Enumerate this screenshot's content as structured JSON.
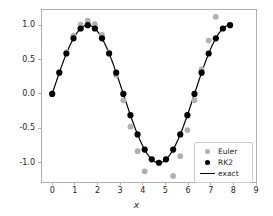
{
  "chart_data": {
    "type": "scatter",
    "title": "",
    "xlabel": "x",
    "ylabel": "",
    "xlim": [
      -0.45,
      9.0
    ],
    "ylim": [
      -1.28,
      1.22
    ],
    "xticks": [
      0,
      1,
      2,
      3,
      4,
      5,
      6,
      7,
      8,
      9
    ],
    "yticks": [
      1.0,
      0.5,
      0.0,
      -0.5,
      -1.0
    ],
    "xticklabels": [
      "0",
      "1",
      "2",
      "3",
      "4",
      "5",
      "6",
      "7",
      "8",
      "9"
    ],
    "yticklabels": [
      "1.0",
      "0.5",
      "0.0",
      "-0.5",
      "-1.0"
    ],
    "grid": false,
    "legend_position": "lower right",
    "step_h": 0.31416,
    "colors": {
      "euler": "#b0b0b0",
      "rk2": "#000000",
      "exact": "#000000",
      "frame": "#b0b0b0",
      "text": "#262626"
    },
    "series": [
      {
        "name": "Euler",
        "type": "scatter",
        "marker": "circle",
        "color": "#b0b0b0",
        "x": [
          0.0,
          0.3142,
          0.6283,
          0.9425,
          1.2566,
          1.5708,
          1.885,
          2.1991,
          2.5133,
          2.8274,
          3.1416,
          3.4558,
          3.7699,
          4.0841,
          4.3982,
          4.7124,
          5.0265,
          5.3407,
          5.6549,
          5.969,
          6.2832,
          6.5973,
          6.9115,
          7.2257,
          7.5398,
          7.854
        ],
        "y": [
          0.0,
          0.3142,
          0.6086,
          0.8489,
          1.0072,
          1.0652,
          1.0142,
          0.8563,
          0.6034,
          0.2769,
          -0.0946,
          -0.4765,
          -0.8319,
          -1.1252,
          -1.3255,
          -1.4097,
          -1.3653,
          -1.1924,
          -0.9043,
          -0.5259,
          -0.0917,
          0.3567,
          0.7753,
          1.1213,
          1.3574,
          1.4562
        ]
      },
      {
        "name": "RK2",
        "type": "scatter",
        "marker": "circle",
        "color": "#000000",
        "x": [
          0.0,
          0.3142,
          0.6283,
          0.9425,
          1.2566,
          1.5708,
          1.885,
          2.1991,
          2.5133,
          2.8274,
          3.1416,
          3.4558,
          3.7699,
          4.0841,
          4.3982,
          4.7124,
          5.0265,
          5.3407,
          5.6549,
          5.969,
          6.2832,
          6.5973,
          6.9115,
          7.2257,
          7.5398,
          7.854
        ],
        "y": [
          0.0,
          0.3091,
          0.5878,
          0.809,
          0.9511,
          1.0,
          0.9511,
          0.809,
          0.5878,
          0.309,
          0.0,
          -0.309,
          -0.5878,
          -0.809,
          -0.9511,
          -1.0,
          -0.9511,
          -0.809,
          -0.5878,
          -0.309,
          0.0,
          0.309,
          0.5878,
          0.809,
          0.9511,
          1.0
        ]
      },
      {
        "name": "exact",
        "type": "line",
        "color": "#000000",
        "function": "sin(x)",
        "x_range": [
          0.0,
          7.854
        ],
        "samples": 400
      }
    ]
  },
  "legend": {
    "items": [
      {
        "label": "Euler",
        "marker": "dot",
        "color": "#b0b0b0"
      },
      {
        "label": "RK2",
        "marker": "dot",
        "color": "#000000"
      },
      {
        "label": "exact",
        "marker": "line",
        "color": "#000000"
      }
    ]
  },
  "axes": {
    "xlabel": "x"
  }
}
